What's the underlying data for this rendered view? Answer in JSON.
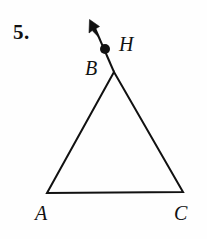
{
  "figure": {
    "problem_number": "5.",
    "kind": "geometry-diagram",
    "background_color": "#fefefe",
    "stroke_color": "#111111",
    "labels": {
      "apex": "B",
      "ray_point": "H",
      "bottom_left": "A",
      "bottom_right": "C"
    },
    "icons": {
      "ray_arrowhead": "arrow-up-left-icon",
      "point_marker": "filled-dot-icon"
    },
    "geometry": {
      "triangle": {
        "name": "triangle-ABC",
        "vertices": [
          {
            "name": "B",
            "x": 114,
            "y": 72
          },
          {
            "name": "A",
            "x": 47,
            "y": 193
          },
          {
            "name": "C",
            "x": 183,
            "y": 192
          }
        ],
        "points_path": "114,72 47,193 183,192",
        "stroke_width": 2
      },
      "ray": {
        "name": "ray-BH",
        "from": {
          "x": 114,
          "y": 72
        },
        "to": {
          "x": 93,
          "y": 24
        },
        "stroke_width": 2,
        "arrow_tip": {
          "x": 90,
          "y": 20
        }
      },
      "point_H": {
        "x": 105,
        "y": 49,
        "radius": 5
      }
    }
  }
}
